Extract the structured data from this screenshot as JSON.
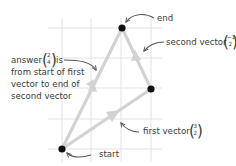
{
  "diagram": {
    "grid": {
      "x_lines": [
        48,
        62,
        91,
        121,
        151
      ],
      "y_lines": [
        28,
        58,
        88,
        119,
        149
      ],
      "color": "#e2e2e2"
    },
    "points": [
      {
        "id": "start",
        "x": 62,
        "y": 149
      },
      {
        "id": "middle",
        "x": 151,
        "y": 89
      },
      {
        "id": "end",
        "x": 122,
        "y": 28
      }
    ],
    "vectors": [
      {
        "id": "first",
        "from": "start",
        "to": "middle",
        "components": [
          3,
          2
        ]
      },
      {
        "id": "second",
        "from": "middle",
        "to": "end",
        "components": [
          -1,
          2
        ]
      },
      {
        "id": "answer",
        "from": "start",
        "to": "end",
        "components": [
          2,
          4
        ]
      }
    ],
    "colors": {
      "arrow": "#d2d2d2",
      "point": "#111111",
      "text": "#3a3a3a",
      "pointer": "#555555"
    },
    "labels": {
      "end": "end",
      "start": "start",
      "second_vector": {
        "text": "second vector",
        "top": "−1",
        "bottom": "2"
      },
      "first_vector": {
        "text": "first vector",
        "top": "3",
        "bottom": "2"
      },
      "answer": {
        "prefix": "answer",
        "top": "2",
        "bottom": "4",
        "suffix": "is",
        "line2": "from start of first",
        "line3": "vector to end of",
        "line4": "second vector"
      }
    }
  }
}
